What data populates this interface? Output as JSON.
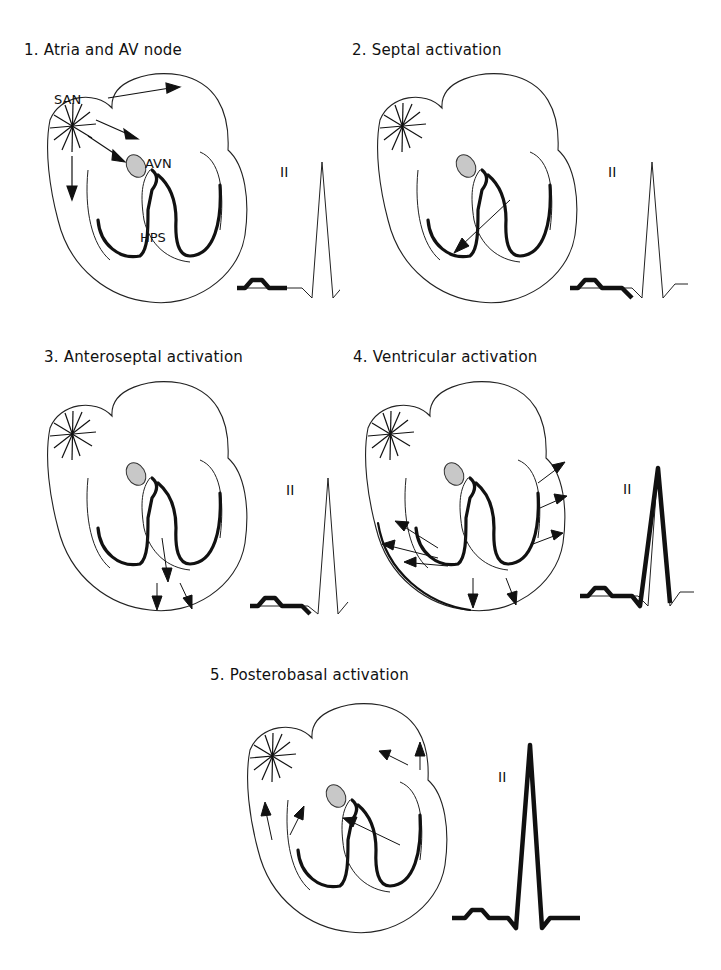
{
  "figure": {
    "panels": [
      {
        "title": "1. Atria and AV node",
        "lead": "II",
        "labels": {
          "san": "SAN",
          "avn": "AVN",
          "hps": "HPS"
        },
        "ecg_highlight": "P wave"
      },
      {
        "title": "2. Septal activation",
        "lead": "II",
        "ecg_highlight": "P wave, PR segment, Q wave"
      },
      {
        "title": "3. Anteroseptal activation",
        "lead": "II",
        "ecg_highlight": "P wave, PR segment, Q wave"
      },
      {
        "title": "4. Ventricular activation",
        "lead": "II",
        "ecg_highlight": "P wave through R wave"
      },
      {
        "title": "5. Posterobasal activation",
        "lead": "II",
        "ecg_highlight": "P wave through S wave (complete)"
      }
    ],
    "colors": {
      "line": "#111111",
      "avn_fill": "#c8c8c8",
      "background": "#ffffff"
    }
  }
}
